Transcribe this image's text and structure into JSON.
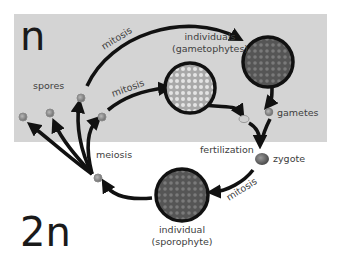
{
  "regions": {
    "haploid": {
      "label": "n",
      "background": "#d4d4d4"
    },
    "diploid": {
      "label": "2n",
      "background": "#ffffff"
    }
  },
  "labels": {
    "spores": "spores",
    "mitosis_top": "mitosis",
    "mitosis_middle": "mitosis",
    "mitosis_bottom": "mitosis",
    "gametophytes_line1": "individuals",
    "gametophytes_line2": "(gametophytes)",
    "gametes": "gametes",
    "fertilization": "fertilization",
    "zygote": "zygote",
    "meiosis": "meiosis",
    "sporophyte_line1": "individual",
    "sporophyte_line2": "(sporophyte)"
  },
  "colors": {
    "arrow": "#111111",
    "cell_dark": "#5a5a5a",
    "cell_light": "#bdbdbd",
    "small_cell": "#8a8a8a",
    "zygote": "#6a6a6a",
    "text": "#404040"
  }
}
